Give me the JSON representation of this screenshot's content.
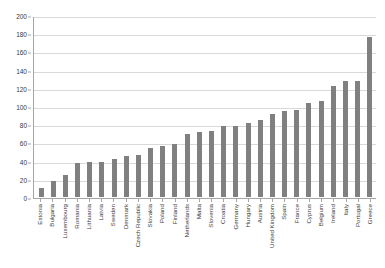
{
  "chart_data": {
    "type": "bar",
    "title": "",
    "subtitle": "",
    "xlabel": "",
    "ylabel": "",
    "ylim": [
      0,
      200
    ],
    "ytick_step": 20,
    "yticks": [
      0,
      20,
      40,
      60,
      80,
      100,
      120,
      140,
      160,
      180,
      200
    ],
    "grid": true,
    "legend": false,
    "legend_position": "none",
    "bar_color": "#808080",
    "grid_color": "#d9d9d9",
    "axis_color": "#a6a6a6",
    "categories": [
      "Estonia",
      "Bulgaria",
      "Luxembourg",
      "Romania",
      "Lithuania",
      "Latvia",
      "Sweden",
      "Denmark",
      "Czech Republic",
      "Slovakia",
      "Poland",
      "Finland",
      "Netherlands",
      "Malta",
      "Slovenia",
      "Croatia",
      "Germany",
      "Hungary",
      "Austria",
      "United Kingdom",
      "Spain",
      "France",
      "Cyprus",
      "Belgium",
      "Ireland",
      "Italy",
      "Portugal",
      "Greece"
    ],
    "values": [
      10,
      18,
      24,
      37,
      38,
      38,
      42,
      45,
      46,
      54,
      56,
      58,
      69,
      71,
      72,
      78,
      78,
      81,
      85,
      91,
      94,
      96,
      103,
      105,
      122,
      128,
      128,
      176
    ]
  }
}
